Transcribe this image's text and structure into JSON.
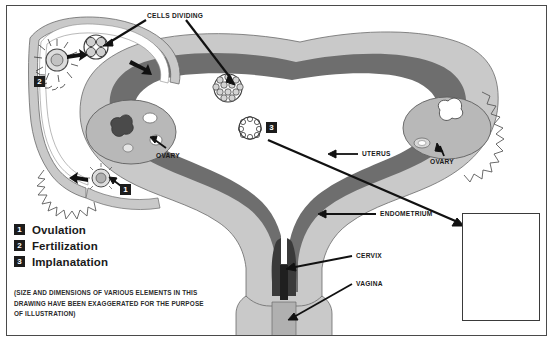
{
  "diagram": {
    "colors": {
      "frame_border": "#4a4a4a",
      "background": "#ffffff",
      "myometrium_light_gray": "#c9c9c9",
      "endometrium_dark_gray": "#6e6e6e",
      "cavity_white": "#ffffff",
      "ovary_gray": "#b8b8b8",
      "outline": "#555555",
      "marker_black": "#1c1c1c",
      "marker_text": "#ffffff",
      "inset_dark": "#1a1a1a",
      "label_text": "#1a1a1a"
    }
  },
  "callouts": {
    "cells_dividing": "CELLS DIVIDING",
    "ovary_left": "OVARY",
    "ovary_right": "OVARY",
    "uterus": "UTERUS",
    "endometrium": "ENDOMETRIUM",
    "cervix": "CERVIX",
    "vagina": "VAGINA"
  },
  "markers": {
    "one": "1",
    "two": "2",
    "three": "3"
  },
  "legend": {
    "items": [
      {
        "num": "1",
        "label": "Ovulation"
      },
      {
        "num": "2",
        "label": "Fertilization"
      },
      {
        "num": "3",
        "label": "Implanatation"
      }
    ]
  },
  "disclaimer": {
    "line1": "(SIZE AND DIMENSIONS OF VARIOUS ELEMENTS IN THIS",
    "line2": "DRAWING HAVE BEEN EXAGGERATED FOR THE PURPOSE",
    "line3": "OF ILLUSTRATION)"
  },
  "inset": {
    "label_line1": "Embryo",
    "label_line2": "(4 weeks)"
  }
}
